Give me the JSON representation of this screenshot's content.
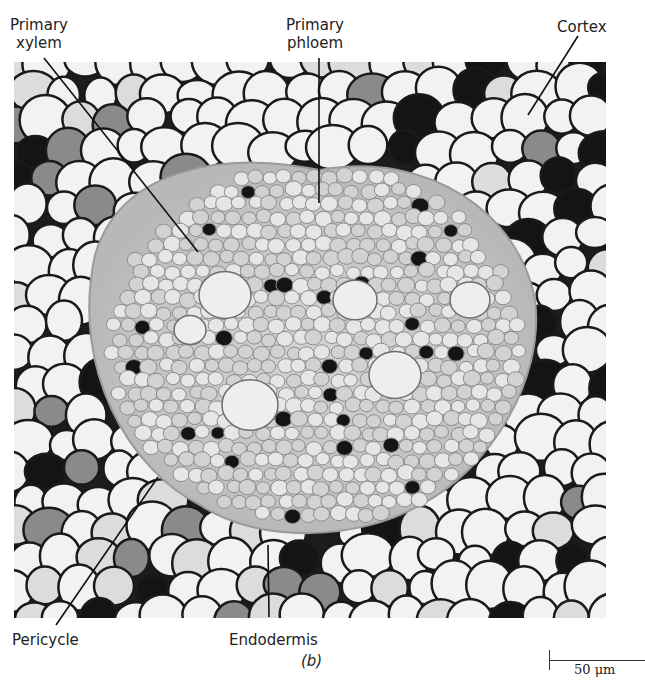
{
  "figure": {
    "panel_label": "(b)",
    "scale_bar": {
      "label": "50 μm"
    },
    "labels": [
      {
        "id": "primary-xylem",
        "lines": [
          "Primary",
          "xylem"
        ],
        "x": 10,
        "y": 16,
        "line": [
          44,
          58,
          198,
          252
        ]
      },
      {
        "id": "primary-phloem",
        "lines": [
          "Primary",
          "phloem"
        ],
        "x": 286,
        "y": 16,
        "line": [
          319,
          58,
          319,
          203
        ]
      },
      {
        "id": "cortex",
        "lines": [
          "Cortex"
        ],
        "x": 557,
        "y": 18,
        "line": [
          578,
          36,
          528,
          115
        ]
      },
      {
        "id": "pericycle",
        "lines": [
          "Pericycle"
        ],
        "x": 12,
        "y": 631,
        "line": [
          56,
          625,
          158,
          477
        ]
      },
      {
        "id": "endodermis",
        "lines": [
          "Endodermis"
        ],
        "x": 229,
        "y": 631,
        "line": [
          269,
          617,
          268,
          545
        ]
      }
    ],
    "colors": {
      "ink": "#222222",
      "cell_wall": "#1a1a1a",
      "cell_light": "#f2f2f2",
      "cell_mid": "#8a8a8a",
      "cell_dark": "#141414",
      "stele": "#bdbdbd"
    }
  }
}
